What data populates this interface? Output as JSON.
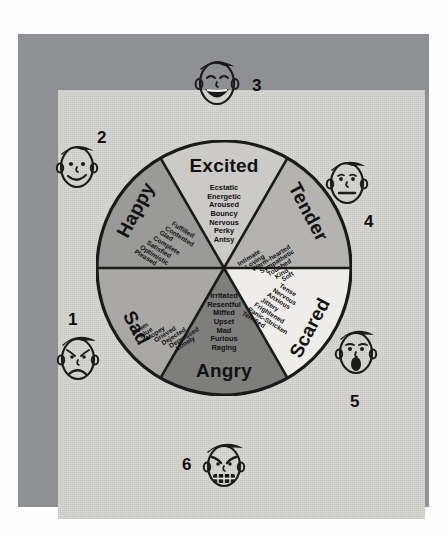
{
  "colors": {
    "frame": "#8f9093",
    "paper": "#d7d6d2",
    "outline": "#1a1a1a",
    "happy": "#9a9a98",
    "excited": "#cbcac6",
    "tender": "#b4b3b0",
    "sad": "#a9a8a5",
    "angry": "#7e7e7c",
    "scared": "#eeede9"
  },
  "wheel": {
    "sectors": [
      {
        "key": "excited",
        "label": "Excited",
        "words": [
          "Ecstatic",
          "Energetic",
          "Aroused",
          "Bouncy",
          "Nervous",
          "Perky",
          "Antsy"
        ]
      },
      {
        "key": "tender",
        "label": "Tender",
        "words": [
          "Intimate",
          "Loving",
          "Warm-hearted",
          "Sympathetic",
          "Touched",
          "Kind",
          "Soft"
        ]
      },
      {
        "key": "scared",
        "label": "Scared",
        "words": [
          "Tense",
          "Nervous",
          "Anxious",
          "Jittery",
          "Frightened",
          "Panic-Stricken",
          "Terrified"
        ]
      },
      {
        "key": "angry",
        "label": "Angry",
        "words": [
          "Irritated",
          "Resentful",
          "Miffed",
          "Upset",
          "Mad",
          "Furious",
          "Raging"
        ]
      },
      {
        "key": "sad",
        "label": "Sad",
        "words": [
          "Down",
          "Blue",
          "Mopey",
          "Grieved",
          "Dejected",
          "Depressed",
          "Lonely"
        ]
      },
      {
        "key": "happy",
        "label": "Happy",
        "words": [
          "Fulfilled",
          "Contented",
          "Glad",
          "Complete",
          "Satisfied",
          "Optimistic",
          "Pleased"
        ]
      }
    ]
  },
  "faces": [
    {
      "number": "1",
      "expression": "sad-crying-face"
    },
    {
      "number": "2",
      "expression": "happy-smiling-face"
    },
    {
      "number": "3",
      "expression": "excited-laughing-face"
    },
    {
      "number": "4",
      "expression": "tender-neutral-face"
    },
    {
      "number": "5",
      "expression": "scared-open-mouth-face"
    },
    {
      "number": "6",
      "expression": "angry-gritted-teeth-face"
    }
  ]
}
